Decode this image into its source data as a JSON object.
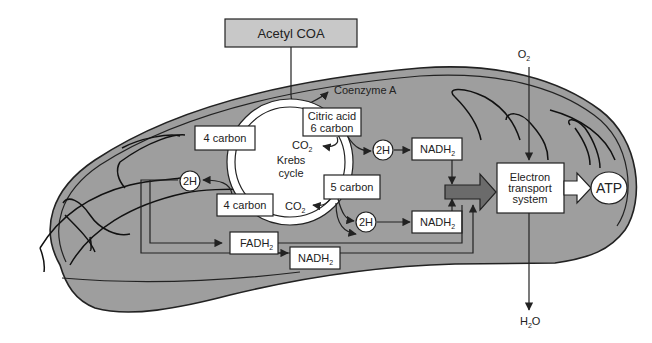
{
  "diagram": {
    "colors": {
      "matrix": "#9e9e9e",
      "acetyl_box": "#c8c8c8",
      "outline": "#222222",
      "big_arrow": "#6b6b6b",
      "box_fill": "#ffffff"
    },
    "input": {
      "acetyl_coa": "Acetyl COA",
      "coenzyme_a": "Coenzyme A"
    },
    "krebs": {
      "center_line1": "Krebs",
      "center_line2": "cycle",
      "citric_line1": "Citric acid",
      "citric_line2": "6 carbon",
      "five_carbon": "5 carbon",
      "four_carbon_top": "4 carbon",
      "four_carbon_bottom": "4 carbon",
      "co2_top": "CO",
      "co2_bottom": "CO",
      "co2_sub": "2"
    },
    "carriers": {
      "h_left": "2H",
      "h_top": "2H",
      "h_bottom": "2H",
      "nadh_top": "NADH",
      "nadh_middle": "NADH",
      "nadh_bottom": "NADH",
      "fadh": "FADH",
      "sub": "2"
    },
    "ets": {
      "line1": "Electron",
      "line2": "transport",
      "line3": "system",
      "atp": "ATP",
      "o2": "O",
      "o2_sub": "2",
      "h2o_h": "H",
      "h2o_sub": "2",
      "h2o_o": "O"
    }
  }
}
